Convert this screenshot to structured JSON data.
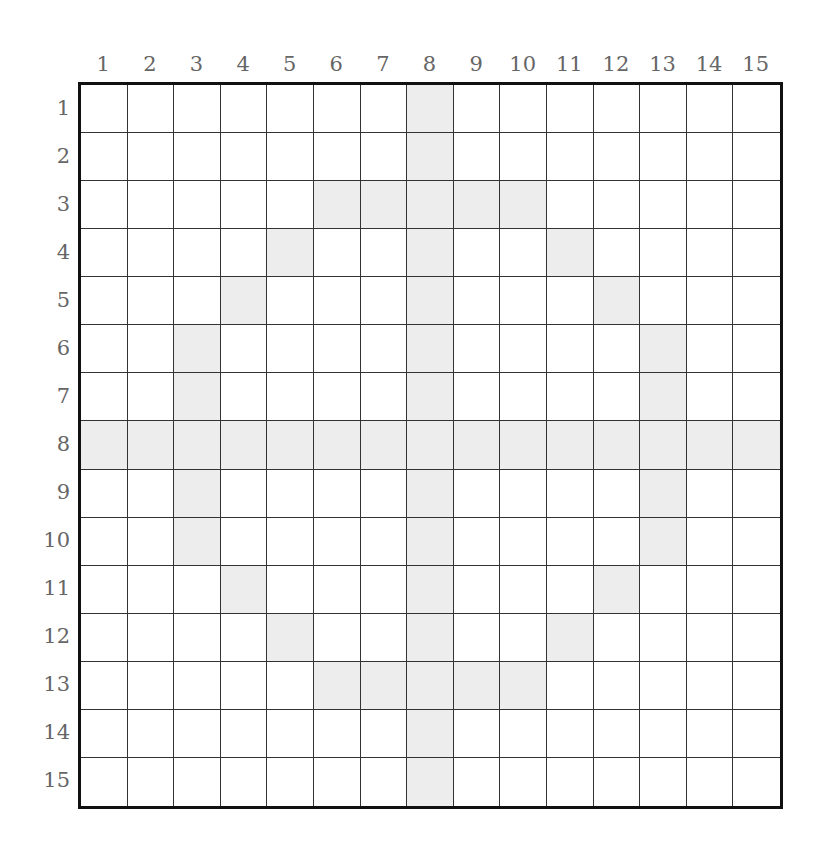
{
  "grid": {
    "rows": 15,
    "cols": 15,
    "column_labels": [
      "1",
      "2",
      "3",
      "4",
      "5",
      "6",
      "7",
      "8",
      "9",
      "10",
      "11",
      "12",
      "13",
      "14",
      "15"
    ],
    "row_labels": [
      "1",
      "2",
      "3",
      "4",
      "5",
      "6",
      "7",
      "8",
      "9",
      "10",
      "11",
      "12",
      "13",
      "14",
      "15"
    ],
    "shaded_color": "#ededed",
    "line_color": "#333333",
    "border_color": "#111111",
    "label_color": "#666666",
    "shaded_cells": [
      [
        1,
        8
      ],
      [
        2,
        8
      ],
      [
        3,
        6
      ],
      [
        3,
        7
      ],
      [
        3,
        8
      ],
      [
        3,
        9
      ],
      [
        3,
        10
      ],
      [
        4,
        5
      ],
      [
        4,
        8
      ],
      [
        4,
        11
      ],
      [
        5,
        4
      ],
      [
        5,
        8
      ],
      [
        5,
        12
      ],
      [
        6,
        3
      ],
      [
        6,
        8
      ],
      [
        6,
        13
      ],
      [
        7,
        3
      ],
      [
        7,
        8
      ],
      [
        7,
        13
      ],
      [
        8,
        1
      ],
      [
        8,
        2
      ],
      [
        8,
        3
      ],
      [
        8,
        4
      ],
      [
        8,
        5
      ],
      [
        8,
        6
      ],
      [
        8,
        7
      ],
      [
        8,
        8
      ],
      [
        8,
        9
      ],
      [
        8,
        10
      ],
      [
        8,
        11
      ],
      [
        8,
        12
      ],
      [
        8,
        13
      ],
      [
        8,
        14
      ],
      [
        8,
        15
      ],
      [
        9,
        3
      ],
      [
        9,
        8
      ],
      [
        9,
        13
      ],
      [
        10,
        3
      ],
      [
        10,
        8
      ],
      [
        10,
        13
      ],
      [
        11,
        4
      ],
      [
        11,
        8
      ],
      [
        11,
        12
      ],
      [
        12,
        5
      ],
      [
        12,
        8
      ],
      [
        12,
        11
      ],
      [
        13,
        6
      ],
      [
        13,
        7
      ],
      [
        13,
        8
      ],
      [
        13,
        9
      ],
      [
        13,
        10
      ],
      [
        14,
        8
      ],
      [
        15,
        8
      ]
    ]
  }
}
